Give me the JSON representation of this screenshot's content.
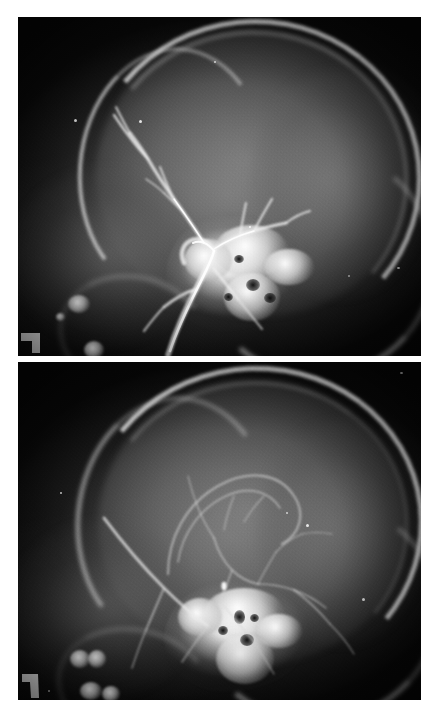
{
  "figure": {
    "title": "Lateral cerebral angiogram series",
    "modality": "Radiograph",
    "projection": "Lateral",
    "panel_count": 2,
    "background_color": "#ffffff",
    "film_color": "#060606",
    "bone_color": "#ffffff",
    "accent_color": "#e8e8e8",
    "caption": ""
  },
  "panels": [
    {
      "id": "panel-upper",
      "name": "upper-radiograph",
      "label": "",
      "phase": "arterial phase",
      "anatomy": "lateral skull with contrast-filled carotid and middle cerebral branches",
      "frame": {
        "x": 18,
        "y": 17,
        "width": 403,
        "height": 341
      },
      "features": {
        "calvarium": "bright double-contour skull vault arc along superior convexity",
        "skull_base": "dense white basal bone and petrous cluster in mid-lower field",
        "vessels": "high-contrast branching arterial tree rising from skull base toward frontal vault",
        "side_marker": "L-shaped radio-opaque marker at lower left",
        "dental_blobs": "bright opacity cluster at lower-left representing dental/cervical opacities"
      }
    },
    {
      "id": "panel-lower",
      "name": "lower-radiograph",
      "label": "",
      "phase": "capillary / venous phase",
      "anatomy": "lateral skull with fine cortical vascular network and sagittal sinus",
      "frame": {
        "x": 18,
        "y": 362,
        "width": 403,
        "height": 338
      },
      "features": {
        "calvarium": "bright skull vault arc with inner-table line visible",
        "skull_base": "dense white basal bone cluster, slightly lower and broader",
        "vessels": "faint fine branching cortical vein network over the hemisphere",
        "side_marker": "L-shaped radio-opaque marker at lower left",
        "dental_blobs": "bright opacity cluster at lower-left"
      }
    }
  ],
  "markers": {
    "side_marker_shape": "right-angle-hook",
    "side_marker_color": "#ffffff",
    "speck_color": "#ffffff"
  }
}
